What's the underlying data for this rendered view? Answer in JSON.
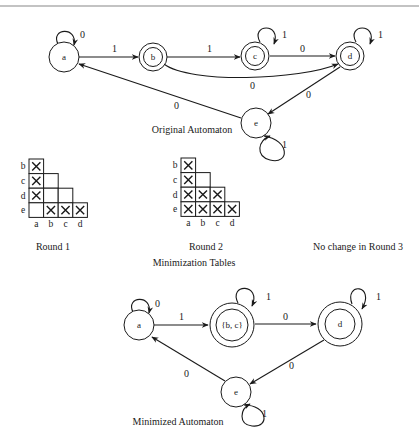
{
  "original": {
    "caption": "Original Automaton",
    "states": [
      {
        "id": "a",
        "label": "a",
        "accepting": false
      },
      {
        "id": "b",
        "label": "b",
        "accepting": true
      },
      {
        "id": "c",
        "label": "c",
        "accepting": true
      },
      {
        "id": "d",
        "label": "d",
        "accepting": true
      },
      {
        "id": "e",
        "label": "e",
        "accepting": false
      }
    ],
    "transitions": [
      {
        "from": "a",
        "to": "a",
        "symbol": "0"
      },
      {
        "from": "a",
        "to": "b",
        "symbol": "1"
      },
      {
        "from": "b",
        "to": "c",
        "symbol": "1"
      },
      {
        "from": "b",
        "to": "d",
        "symbol": "0"
      },
      {
        "from": "c",
        "to": "c",
        "symbol": "1"
      },
      {
        "from": "c",
        "to": "d",
        "symbol": "0"
      },
      {
        "from": "d",
        "to": "d",
        "symbol": "1"
      },
      {
        "from": "d",
        "to": "e",
        "symbol": "0"
      },
      {
        "from": "e",
        "to": "e",
        "symbol": "1"
      },
      {
        "from": "e",
        "to": "a",
        "symbol": "0"
      }
    ]
  },
  "tables": {
    "caption": "Minimization Tables",
    "row_labels": [
      "b",
      "c",
      "d",
      "e"
    ],
    "col_labels": [
      "a",
      "b",
      "c",
      "d"
    ],
    "rounds": [
      {
        "caption": "Round 1",
        "marks": [
          [
            true
          ],
          [
            true,
            false
          ],
          [
            true,
            false,
            false
          ],
          [
            false,
            true,
            true,
            true
          ]
        ]
      },
      {
        "caption": "Round 2",
        "marks": [
          [
            true
          ],
          [
            true,
            false
          ],
          [
            true,
            true,
            true
          ],
          [
            true,
            true,
            true,
            true
          ]
        ]
      }
    ],
    "round3_note": "No change in Round 3"
  },
  "minimized": {
    "caption": "Minimized Automaton",
    "states": [
      {
        "id": "a",
        "label": "a",
        "accepting": false
      },
      {
        "id": "bc",
        "label": "{b, c}",
        "accepting": true
      },
      {
        "id": "d",
        "label": "d",
        "accepting": true
      },
      {
        "id": "e",
        "label": "e",
        "accepting": false
      }
    ],
    "transitions": [
      {
        "from": "a",
        "to": "a",
        "symbol": "0"
      },
      {
        "from": "a",
        "to": "bc",
        "symbol": "1"
      },
      {
        "from": "bc",
        "to": "bc",
        "symbol": "1"
      },
      {
        "from": "bc",
        "to": "d",
        "symbol": "0"
      },
      {
        "from": "d",
        "to": "d",
        "symbol": "1"
      },
      {
        "from": "d",
        "to": "e",
        "symbol": "0"
      },
      {
        "from": "e",
        "to": "e",
        "symbol": "1"
      },
      {
        "from": "e",
        "to": "a",
        "symbol": "0"
      }
    ]
  }
}
